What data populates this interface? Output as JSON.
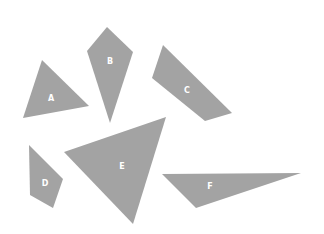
{
  "diagram": {
    "fill_color": "#a3a3a3",
    "label_color": "#ffffff",
    "shapes": [
      {
        "id": "A",
        "label": "A",
        "points": "42,60 23,118 89,106",
        "label_x": 51,
        "label_y": 99
      },
      {
        "id": "B",
        "label": "B",
        "points": "107,27 87,51 110,123 133,52",
        "label_x": 110,
        "label_y": 62
      },
      {
        "id": "C",
        "label": "C",
        "points": "163,45 152,78 205,121 232,113",
        "label_x": 187,
        "label_y": 91
      },
      {
        "id": "D",
        "label": "D",
        "points": "29,145 30,195 53,208 63,179",
        "label_x": 45,
        "label_y": 184
      },
      {
        "id": "E",
        "label": "E",
        "points": "64,152 166,117 133,224",
        "label_x": 122,
        "label_y": 167
      },
      {
        "id": "F",
        "label": "F",
        "points": "162,174 301,173 196,208",
        "label_x": 210,
        "label_y": 187
      }
    ]
  }
}
